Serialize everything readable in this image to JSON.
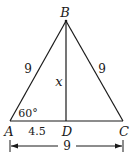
{
  "figure": {
    "vertices": {
      "A": {
        "label": "A",
        "x": 10,
        "y": 121
      },
      "B": {
        "label": "B",
        "x": 66,
        "y": 21
      },
      "C": {
        "label": "C",
        "x": 123,
        "y": 121
      },
      "D": {
        "label": "D",
        "x": 66,
        "y": 121
      }
    },
    "labels": {
      "side_AB": "9",
      "side_BC": "9",
      "altitude_BD": "x",
      "segment_AD": "4.5",
      "angle_A": "60°",
      "base_AC": "9"
    },
    "colors": {
      "line": "#1a1a1a",
      "background": "#ffffff"
    }
  }
}
